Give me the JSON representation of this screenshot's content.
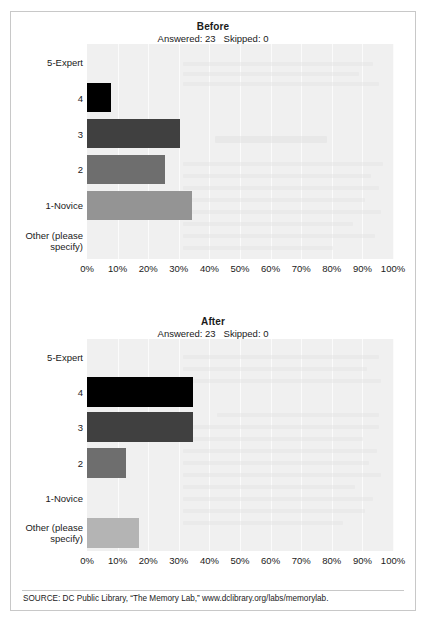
{
  "figure": {
    "source_note": "SOURCE: DC Public Library, “The Memory Lab,” www.dclibrary.org/labs/memorylab."
  },
  "chart_data": [
    {
      "type": "bar",
      "orientation": "horizontal",
      "title": "Before",
      "subtitle": "Answered: 23   Skipped: 0",
      "answered": "23",
      "skipped": "0",
      "xlabel": "",
      "ylabel": "",
      "xlim": [
        0,
        100
      ],
      "xticks": [
        "0%",
        "10%",
        "20%",
        "30%",
        "40%",
        "50%",
        "60%",
        "70%",
        "80%",
        "90%",
        "100%"
      ],
      "grid": true,
      "legend": "none",
      "categories": [
        "5-Expert",
        "4",
        "3",
        "2",
        "1-Novice",
        "Other (please\nspecify)"
      ],
      "values": [
        0,
        8,
        30.4,
        25.5,
        34.3,
        0
      ],
      "colors": [
        "#f0f0f0",
        "#000000",
        "#404040",
        "#6e6e6e",
        "#949494",
        "#b4b4b4"
      ]
    },
    {
      "type": "bar",
      "orientation": "horizontal",
      "title": "After",
      "subtitle": "Answered: 23   Skipped: 0",
      "answered": "23",
      "skipped": "0",
      "xlabel": "",
      "ylabel": "",
      "xlim": [
        0,
        100
      ],
      "xticks": [
        "0%",
        "10%",
        "20%",
        "30%",
        "40%",
        "50%",
        "60%",
        "70%",
        "80%",
        "90%",
        "100%"
      ],
      "grid": true,
      "legend": "none",
      "categories": [
        "5-Expert",
        "4",
        "3",
        "2",
        "1-Novice",
        "Other (please\nspecify)"
      ],
      "values": [
        0,
        34.6,
        34.6,
        12.7,
        0,
        17.0
      ],
      "colors": [
        "#f0f0f0",
        "#000000",
        "#404040",
        "#6e6e6e",
        "#949494",
        "#b4b4b4"
      ]
    }
  ]
}
